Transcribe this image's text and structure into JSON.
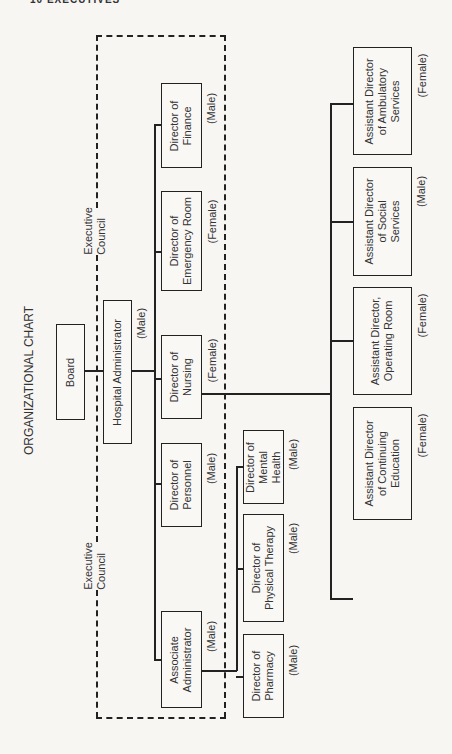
{
  "header_fragment": "10 EXECUTIVES",
  "title": "ORGANIZATIONAL CHART",
  "group_labels": {
    "executive_council_top": "Executive\nCouncil",
    "executive_council_bottom": "Executive\nCouncil"
  },
  "nodes": {
    "board": {
      "title": "Board",
      "gender": ""
    },
    "hospital_administrator": {
      "title": "Hospital Administrator",
      "gender": "(Male)"
    },
    "director_finance": {
      "title": "Director of\nFinance",
      "gender": "(Male)"
    },
    "director_emergency_room": {
      "title": "Director of\nEmergency Room",
      "gender": "(Female)"
    },
    "director_nursing": {
      "title": "Director of\nNursing",
      "gender": "(Female)"
    },
    "director_personnel": {
      "title": "Director of\nPersonnel",
      "gender": "(Male)"
    },
    "associate_administrator": {
      "title": "Associate\nAdministrator",
      "gender": "(Male)"
    },
    "director_mental_health": {
      "title": "Director of\nMental\nHealth",
      "gender": "(Male)"
    },
    "director_physical_therapy": {
      "title": "Director of\nPhysical Therapy",
      "gender": "(Male)"
    },
    "director_pharmacy": {
      "title": "Director of\nPharmacy",
      "gender": "(Male)"
    },
    "asst_director_ambulatory": {
      "title": "Assistant Director\nof Ambulatory\nServices",
      "gender": "(Female)"
    },
    "asst_director_social": {
      "title": "Assistant Director\nof Social\nServices",
      "gender": "(Male)"
    },
    "asst_director_or": {
      "title": "Assistant Director,\nOperating Room",
      "gender": "(Female)"
    },
    "asst_director_continuing_ed": {
      "title": "Assistant Director\nof Continuing\nEducation",
      "gender": "(Female)"
    }
  },
  "hierarchy": {
    "Board": [
      "Hospital Administrator"
    ],
    "Hospital Administrator": [
      "Director of Finance",
      "Director of Emergency Room",
      "Director of Nursing",
      "Director of Personnel",
      "Associate Administrator"
    ],
    "Director of Nursing": [
      "Assistant Director of Ambulatory Services",
      "Assistant Director of Social Services",
      "Assistant Director, Operating Room",
      "Assistant Director of Continuing Education"
    ],
    "Associate Administrator": [
      "Director of Mental Health",
      "Director of Physical Therapy",
      "Director of Pharmacy"
    ]
  }
}
